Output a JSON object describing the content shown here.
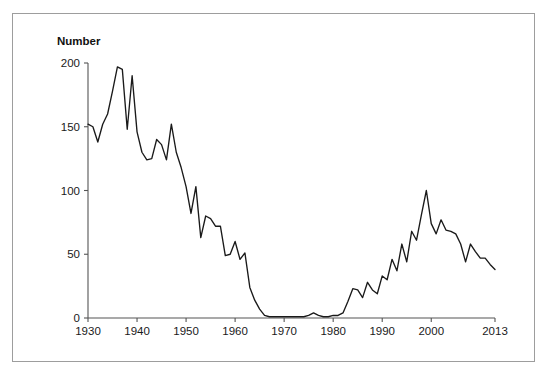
{
  "figure": {
    "frame_border_color": "#9d9d9d",
    "background_color": "#ffffff"
  },
  "chart_data": {
    "type": "line",
    "title": "",
    "subtitle": "",
    "xlabel": "",
    "ylabel": "Number",
    "ylabel_position": "top-left-above-axis",
    "grid": false,
    "legend": false,
    "legend_position": "none",
    "line_color": "#1a1a1a",
    "xlim": [
      1930,
      2013
    ],
    "ylim": [
      0,
      200
    ],
    "xticks": [
      1930,
      1940,
      1950,
      1960,
      1970,
      1980,
      1990,
      2000,
      2013
    ],
    "xtick_labels": [
      "1930",
      "1940",
      "1950",
      "1960",
      "1970",
      "1980",
      "1990",
      "2000",
      "2013"
    ],
    "yticks": [
      0,
      50,
      100,
      150,
      200
    ],
    "ytick_labels": [
      "0",
      "50",
      "100",
      "150",
      "200"
    ],
    "x": [
      1930,
      1931,
      1932,
      1933,
      1934,
      1935,
      1936,
      1937,
      1938,
      1939,
      1940,
      1941,
      1942,
      1943,
      1944,
      1945,
      1946,
      1947,
      1948,
      1949,
      1950,
      1951,
      1952,
      1953,
      1954,
      1955,
      1956,
      1957,
      1958,
      1959,
      1960,
      1961,
      1962,
      1963,
      1964,
      1965,
      1966,
      1967,
      1968,
      1969,
      1970,
      1971,
      1972,
      1973,
      1974,
      1975,
      1976,
      1977,
      1978,
      1979,
      1980,
      1981,
      1982,
      1983,
      1984,
      1985,
      1986,
      1987,
      1988,
      1989,
      1990,
      1991,
      1992,
      1993,
      1994,
      1995,
      1996,
      1997,
      1998,
      1999,
      2000,
      2001,
      2002,
      2003,
      2004,
      2005,
      2006,
      2007,
      2008,
      2009,
      2010,
      2011,
      2012,
      2013
    ],
    "values": [
      152,
      150,
      138,
      152,
      160,
      178,
      197,
      195,
      148,
      190,
      146,
      130,
      124,
      125,
      140,
      136,
      124,
      152,
      130,
      118,
      103,
      82,
      103,
      63,
      80,
      78,
      72,
      72,
      49,
      50,
      60,
      46,
      51,
      24,
      14,
      7,
      2,
      1,
      1,
      1,
      1,
      1,
      1,
      1,
      1,
      2,
      4,
      2,
      1,
      1,
      2,
      2,
      4,
      13,
      23,
      22,
      16,
      28,
      22,
      19,
      33,
      30,
      46,
      37,
      58,
      44,
      68,
      61,
      81,
      100,
      74,
      66,
      77,
      69,
      68,
      66,
      58,
      44,
      58,
      52,
      47,
      47,
      42,
      38
    ],
    "series": [
      {
        "name": "Number",
        "values": [
          152,
          150,
          138,
          152,
          160,
          178,
          197,
          195,
          148,
          190,
          146,
          130,
          124,
          125,
          140,
          136,
          124,
          152,
          130,
          118,
          103,
          82,
          103,
          63,
          80,
          78,
          72,
          72,
          49,
          50,
          60,
          46,
          51,
          24,
          14,
          7,
          2,
          1,
          1,
          1,
          1,
          1,
          1,
          1,
          1,
          2,
          4,
          2,
          1,
          1,
          2,
          2,
          4,
          13,
          23,
          22,
          16,
          28,
          22,
          19,
          33,
          30,
          46,
          37,
          58,
          44,
          68,
          61,
          81,
          100,
          74,
          66,
          77,
          69,
          68,
          66,
          58,
          44,
          58,
          52,
          47,
          47,
          42,
          38
        ]
      }
    ],
    "annotations": []
  }
}
